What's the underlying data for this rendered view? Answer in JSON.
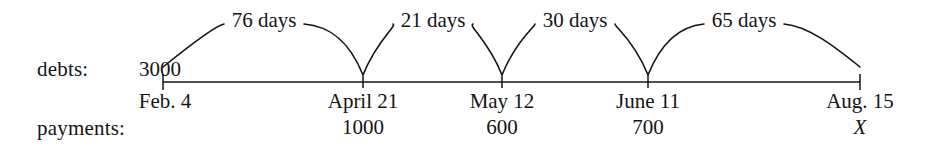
{
  "figure": {
    "row_labels": {
      "debts": "debts:",
      "payments": "payments:"
    },
    "debt_amount": "3000",
    "axis": {
      "y": 82,
      "x_start": 163,
      "x_end": 860,
      "stroke_color": "#141414"
    },
    "points": [
      {
        "name": "feb-4",
        "date": "Feb. 4",
        "x": 163,
        "payment": ""
      },
      {
        "name": "april-21",
        "date": "April 21",
        "x": 363,
        "payment": "1000"
      },
      {
        "name": "may-12",
        "date": "May 12",
        "x": 502,
        "payment": "600"
      },
      {
        "name": "june-11",
        "date": "June 11",
        "x": 648,
        "payment": "700"
      },
      {
        "name": "aug-15",
        "date": "Aug. 15",
        "x": 860,
        "payment": "X"
      }
    ],
    "intervals": [
      {
        "name": "feb4-april21",
        "label": "76 days",
        "x": 264,
        "from_x": 163,
        "to_x": 363
      },
      {
        "name": "april21-may12",
        "label": "21 days",
        "x": 433,
        "from_x": 363,
        "to_x": 502
      },
      {
        "name": "may12-june11",
        "label": "30 days",
        "x": 575,
        "from_x": 502,
        "to_x": 648
      },
      {
        "name": "june11-aug15",
        "label": "65 days",
        "x": 744,
        "from_x": 648,
        "to_x": 860
      }
    ]
  },
  "chart_data": {
    "type": "table",
    "columns": [
      "date",
      "debt",
      "payment",
      "days_to_next"
    ],
    "rows": [
      {
        "date": "Feb. 4",
        "debt": "3000",
        "payment": "",
        "days_to_next": 76
      },
      {
        "date": "April 21",
        "debt": "",
        "payment": "1000",
        "days_to_next": 21
      },
      {
        "date": "May 12",
        "debt": "",
        "payment": "600",
        "days_to_next": 30
      },
      {
        "date": "June 11",
        "debt": "",
        "payment": "700",
        "days_to_next": 65
      },
      {
        "date": "Aug. 15",
        "debt": "",
        "payment": "X",
        "days_to_next": null
      }
    ],
    "axis_label": "",
    "annotations": [
      "76 days",
      "21 days",
      "30 days",
      "65 days"
    ]
  }
}
